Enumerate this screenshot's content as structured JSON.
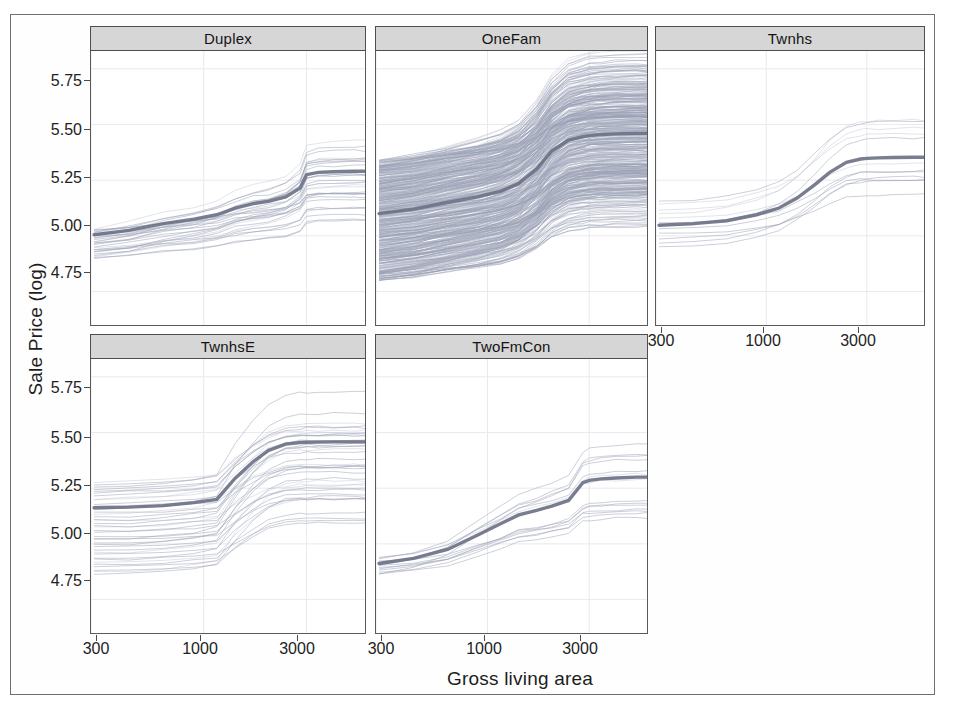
{
  "chart_data": {
    "type": "line",
    "title": "",
    "xlabel": "Gross living area",
    "ylabel": "Sale Price (log)",
    "xscale": "log",
    "xlim": [
      300,
      5600
    ],
    "ylim": [
      4.6,
      5.83
    ],
    "xticks": [
      300,
      1000,
      3000
    ],
    "xtick_labels": [
      "300",
      "1000",
      "3000"
    ],
    "yticks": [
      4.75,
      5.0,
      5.25,
      5.5,
      5.75
    ],
    "ytick_labels": [
      "4.75",
      "5.00",
      "5.25",
      "5.50",
      "5.75"
    ],
    "grid": true,
    "legend": "none",
    "facet_variable": "Building Type",
    "facets": [
      {
        "label": "Duplex",
        "row": 0,
        "col": 0,
        "n_curves": 30,
        "pdp": {
          "x": [
            310,
            450,
            650,
            900,
            1150,
            1400,
            1700,
            2000,
            2400,
            2800,
            3000,
            3400,
            4000,
            5000,
            5600
          ],
          "y": [
            5.005,
            5.025,
            5.055,
            5.075,
            5.095,
            5.125,
            5.145,
            5.155,
            5.175,
            5.215,
            5.275,
            5.285,
            5.288,
            5.29,
            5.29
          ]
        },
        "ice_spread": [
          4.9,
          5.32
        ],
        "y_start": 5.0,
        "y_end": 5.29
      },
      {
        "label": "OneFam",
        "row": 0,
        "col": 1,
        "n_curves": 400,
        "pdp": {
          "x": [
            310,
            450,
            650,
            900,
            1150,
            1400,
            1700,
            2000,
            2400,
            2800,
            3000,
            3400,
            4000,
            5000,
            5600
          ],
          "y": [
            5.1,
            5.12,
            5.15,
            5.175,
            5.2,
            5.235,
            5.3,
            5.38,
            5.43,
            5.445,
            5.45,
            5.455,
            5.458,
            5.46,
            5.46
          ]
        },
        "ice_spread": [
          4.8,
          5.7
        ],
        "y_start": 5.1,
        "y_end": 5.46
      },
      {
        "label": "Twnhs",
        "row": 0,
        "col": 2,
        "n_curves": 12,
        "pdp": {
          "x": [
            310,
            450,
            650,
            900,
            1150,
            1400,
            1700,
            2000,
            2400,
            2800,
            3000,
            3400,
            4000,
            5000,
            5600
          ],
          "y": [
            5.048,
            5.055,
            5.068,
            5.095,
            5.125,
            5.17,
            5.23,
            5.285,
            5.33,
            5.345,
            5.348,
            5.35,
            5.352,
            5.353,
            5.353
          ]
        },
        "ice_spread": [
          4.95,
          5.46
        ],
        "y_start": 5.05,
        "y_end": 5.35
      },
      {
        "label": "TwnhsE",
        "row": 1,
        "col": 0,
        "n_curves": 40,
        "pdp": {
          "x": [
            310,
            450,
            650,
            900,
            1150,
            1400,
            1700,
            2000,
            2400,
            2800,
            3000,
            3400,
            4000,
            5000,
            5600
          ],
          "y": [
            5.162,
            5.165,
            5.172,
            5.185,
            5.2,
            5.295,
            5.37,
            5.42,
            5.448,
            5.455,
            5.456,
            5.457,
            5.458,
            5.458,
            5.458
          ]
        },
        "ice_spread": [
          4.86,
          5.58
        ],
        "y_start": 5.16,
        "y_end": 5.46
      },
      {
        "label": "TwoFmCon",
        "row": 1,
        "col": 1,
        "n_curves": 14,
        "pdp": {
          "x": [
            310,
            450,
            650,
            900,
            1150,
            1400,
            1700,
            2000,
            2400,
            2800,
            3000,
            3400,
            4000,
            5000,
            5600
          ],
          "y": [
            4.912,
            4.935,
            4.975,
            5.04,
            5.09,
            5.13,
            5.15,
            5.17,
            5.195,
            5.275,
            5.285,
            5.292,
            5.296,
            5.3,
            5.3
          ]
        },
        "ice_spread": [
          4.86,
          5.33
        ],
        "y_start": 4.91,
        "y_end": 5.3
      }
    ]
  },
  "colors": {
    "ice_line": "#9aa0b4",
    "pdp_line": "#6d7287",
    "strip_background": "#d6d6d6",
    "panel_border": "#5a5a5a",
    "gridline": "#e9e9ee",
    "page_frame": "#6f6f6f"
  }
}
